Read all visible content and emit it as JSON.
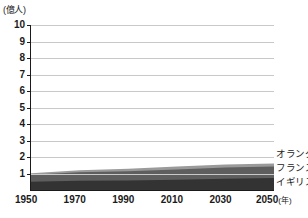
{
  "chart": {
    "unit_label": "(億人)",
    "x_axis_suffix": "(年)"
  },
  "axis": {
    "y_ticks": [
      "10",
      "9",
      "8",
      "7",
      "6",
      "5",
      "4",
      "3",
      "2",
      "1"
    ],
    "x_ticks": [
      "1950",
      "1970",
      "1990",
      "2010",
      "2030",
      "2050"
    ]
  },
  "legend": {
    "items": [
      {
        "label": "オランダ",
        "color": "#9a9a9a"
      },
      {
        "label": "フランス",
        "color": "#5e5e5e"
      },
      {
        "label": "イギリス",
        "color": "#333333"
      }
    ]
  },
  "chart_data": {
    "type": "area",
    "title": "",
    "xlabel": "(年)",
    "ylabel": "(億人)",
    "xlim": [
      1950,
      2050
    ],
    "ylim": [
      0,
      10
    ],
    "grid": true,
    "stacked": true,
    "legend_position": "right",
    "x": [
      1950,
      1970,
      1990,
      2010,
      2030,
      2050
    ],
    "series": [
      {
        "name": "イギリス",
        "color": "#333333",
        "values": [
          0.5,
          0.56,
          0.57,
          0.62,
          0.68,
          0.72
        ]
      },
      {
        "name": "フランス",
        "color": "#5e5e5e",
        "values": [
          0.42,
          0.51,
          0.57,
          0.63,
          0.68,
          0.71
        ]
      },
      {
        "name": "オランダ",
        "color": "#9a9a9a",
        "values": [
          0.1,
          0.13,
          0.15,
          0.17,
          0.18,
          0.18
        ]
      }
    ],
    "totals": [
      1.02,
      1.2,
      1.29,
      1.42,
      1.54,
      1.61
    ]
  }
}
